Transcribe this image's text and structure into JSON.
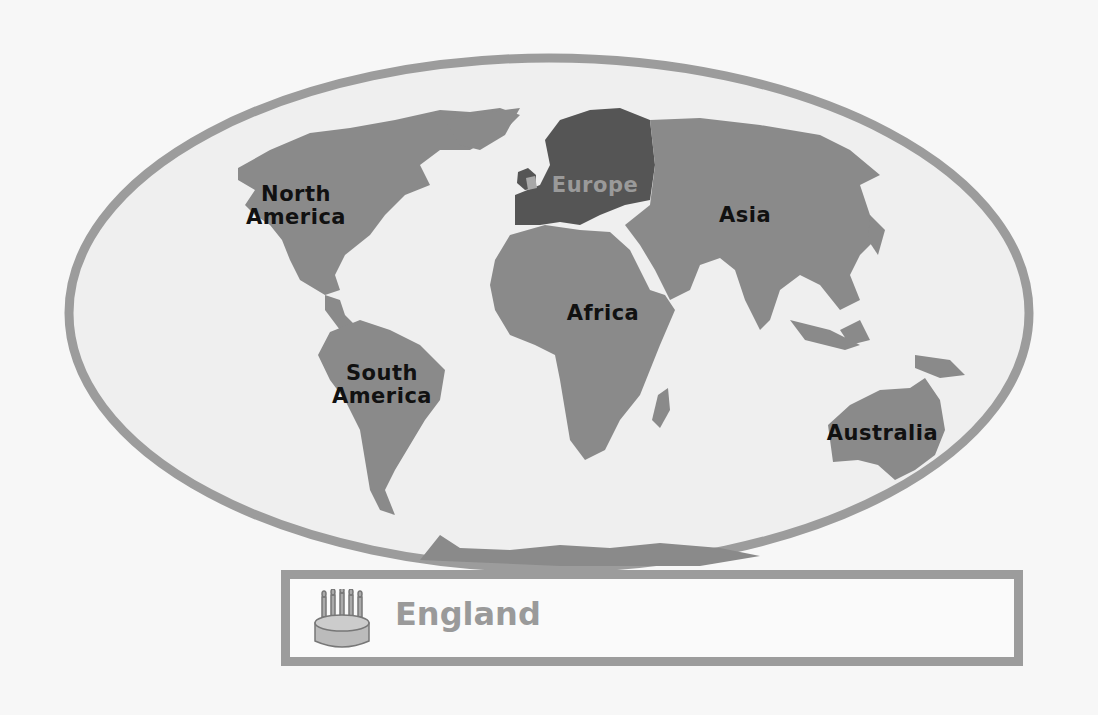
{
  "map": {
    "type": "world-continents",
    "highlighted_region": "Europe",
    "highlighted_country": "England",
    "colors": {
      "background": "#f7f7f7",
      "ocean": "#efefef",
      "land": "#8a8a8a",
      "highlight": "#555555",
      "england": "#a8a8a8",
      "rim": "#9c9c9c",
      "label": "#111111",
      "highlight_label": "#9a9a9a"
    },
    "labels": {
      "north_america_1": "North",
      "north_america_2": "America",
      "south_america_1": "South",
      "south_america_2": "America",
      "europe": "Europe",
      "asia": "Asia",
      "africa": "Africa",
      "australia": "Australia"
    }
  },
  "caption": {
    "icon": "birthday-cake-icon",
    "title": "England"
  }
}
